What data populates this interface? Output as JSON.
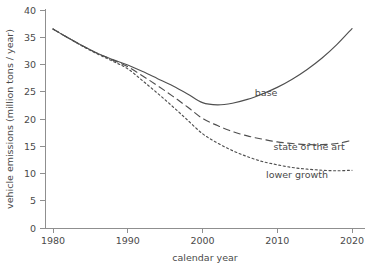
{
  "chart_data": {
    "type": "line",
    "title": "",
    "xlabel": "calendar year",
    "ylabel": "vehicle emissions (million tons / year)",
    "xlim": [
      1978,
      2022
    ],
    "ylim": [
      0,
      40
    ],
    "xticks": [
      1980,
      1990,
      2000,
      2010,
      2020
    ],
    "xtick_labels": [
      "1980",
      "1990",
      "2000",
      "2010",
      "2020"
    ],
    "yticks": [
      0,
      5,
      10,
      15,
      20,
      25,
      30,
      35,
      40
    ],
    "ytick_labels": [
      "0",
      "5",
      "10",
      "15",
      "20",
      "25",
      "30",
      "35",
      "40"
    ],
    "grid": false,
    "legend_position": "inline-annotations",
    "x": [
      1980,
      1982,
      1984,
      1986,
      1988,
      1990,
      1992,
      1994,
      1996,
      1998,
      2000,
      2002,
      2004,
      2006,
      2008,
      2010,
      2012,
      2014,
      2016,
      2018,
      2020
    ],
    "series": [
      {
        "name": "base",
        "style": "solid",
        "label_x": 2007,
        "label_y": 24.2,
        "values": [
          36.5,
          34.9,
          33.4,
          32.0,
          30.9,
          29.9,
          28.7,
          27.4,
          26.1,
          24.6,
          23.0,
          22.6,
          22.9,
          23.6,
          24.6,
          25.8,
          27.3,
          29.1,
          31.2,
          33.7,
          36.6
        ]
      },
      {
        "name": "state of the art",
        "style": "dashed",
        "label_x": 2009.5,
        "label_y": 14.3,
        "values": [
          36.5,
          34.9,
          33.4,
          32.0,
          30.8,
          29.6,
          27.9,
          26.1,
          24.2,
          22.2,
          20.1,
          18.8,
          17.7,
          16.9,
          16.3,
          15.8,
          15.5,
          15.3,
          15.3,
          15.5,
          16.1
        ]
      },
      {
        "name": "lower growth",
        "style": "dotted",
        "label_x": 2008.5,
        "label_y": 9.1,
        "values": [
          36.5,
          34.9,
          33.3,
          31.9,
          30.6,
          29.2,
          27.0,
          24.7,
          22.3,
          19.8,
          17.3,
          15.6,
          14.2,
          13.1,
          12.2,
          11.6,
          11.1,
          10.8,
          10.6,
          10.5,
          10.6
        ]
      }
    ]
  },
  "style": {
    "curve_color": "#4f4f4f",
    "axis_color": "#8f8f8f",
    "text_color": "#4a4a4a",
    "background": "#ffffff"
  }
}
